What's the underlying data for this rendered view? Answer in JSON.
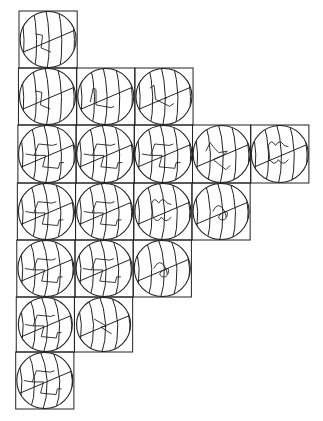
{
  "diagram": {
    "type": "globe-projection-grid",
    "rows": [
      {
        "row": 1,
        "cells": [
          {
            "col": 1,
            "coastline": "continents-a"
          }
        ]
      },
      {
        "row": 2,
        "cells": [
          {
            "col": 1,
            "coastline": "continents-a"
          },
          {
            "col": 2,
            "coastline": "continents-b"
          },
          {
            "col": 3,
            "coastline": "continents-c"
          }
        ]
      },
      {
        "row": 3,
        "cells": [
          {
            "col": 1,
            "coastline": "s-shape"
          },
          {
            "col": 2,
            "coastline": "s-shape"
          },
          {
            "col": 3,
            "coastline": "s-shape"
          },
          {
            "col": 4,
            "coastline": "squiggle"
          },
          {
            "col": 5,
            "coastline": "m-shape"
          }
        ]
      },
      {
        "row": 4,
        "cells": [
          {
            "col": 1,
            "coastline": "s-shape"
          },
          {
            "col": 2,
            "coastline": "s-shape"
          },
          {
            "col": 3,
            "coastline": "m-shape"
          },
          {
            "col": 4,
            "coastline": "loop"
          }
        ]
      },
      {
        "row": 5,
        "cells": [
          {
            "col": 1,
            "coastline": "s-shape"
          },
          {
            "col": 2,
            "coastline": "s-shape"
          },
          {
            "col": 3,
            "coastline": "loop"
          }
        ]
      },
      {
        "row": 6,
        "cells": [
          {
            "col": 1,
            "coastline": "s-shape"
          },
          {
            "col": 2,
            "coastline": "zigzag"
          }
        ]
      },
      {
        "row": 7,
        "cells": [
          {
            "col": 1,
            "coastline": "s-shape"
          }
        ]
      }
    ]
  }
}
